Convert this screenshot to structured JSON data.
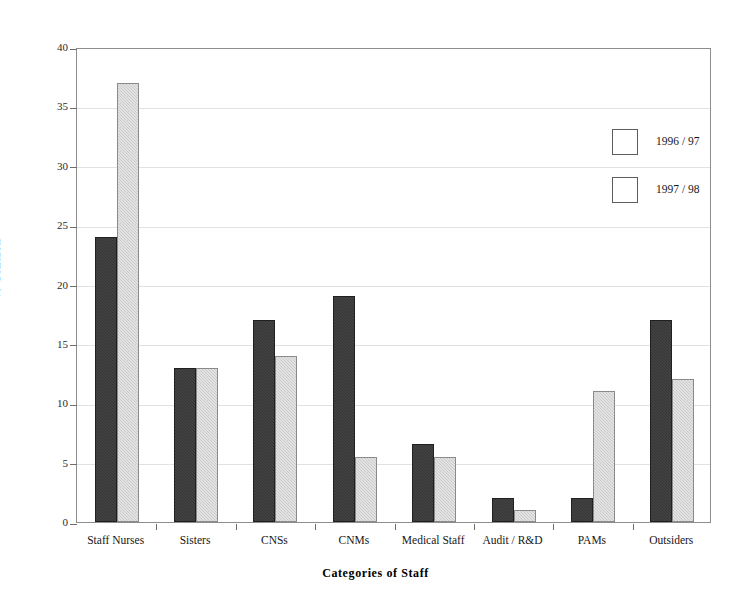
{
  "chart_data": {
    "type": "bar",
    "title": "",
    "xlabel": "Categories of Staff",
    "ylabel": "% Contacts",
    "categories": [
      "Staff Nurses",
      "Sisters",
      "CNSs",
      "CNMs",
      "Medical Staff",
      "Audit / R&D",
      "PAMs",
      "Outsiders"
    ],
    "series": [
      {
        "name": "1996 / 97",
        "color": "#343434",
        "values": [
          24,
          13,
          17,
          19,
          6.6,
          2,
          2,
          17
        ]
      },
      {
        "name": "1997 / 98",
        "color": "#cbcbcb",
        "values": [
          37,
          13,
          14,
          5.5,
          5.5,
          1,
          11,
          12
        ]
      }
    ],
    "ylim": [
      0,
      40
    ],
    "ytick_labels": [
      "0",
      "5",
      "10",
      "15",
      "20",
      "25",
      "30",
      "35",
      "40"
    ],
    "ytick_values": [
      0,
      5,
      10,
      15,
      20,
      25,
      30,
      35,
      40
    ],
    "grid": "horizontal",
    "legend_position": "top-right",
    "frame": "box"
  },
  "legend": {
    "entries": [
      {
        "label": "1996 / 97"
      },
      {
        "label": "1997 / 98"
      }
    ]
  },
  "axes": {
    "y_title": "% Contacts",
    "x_title": "Categories of Staff"
  }
}
